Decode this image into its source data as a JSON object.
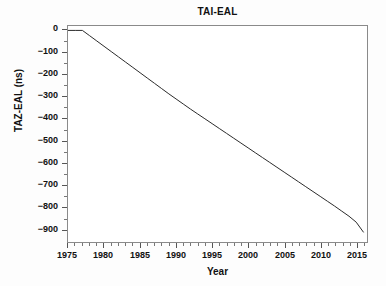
{
  "chart_data": {
    "type": "line",
    "title": "TAI-EAL",
    "xlabel": "Year",
    "ylabel": "TAZ-EAL (ns)",
    "xlim": [
      1975,
      2016.5
    ],
    "ylim": [
      -960,
      20
    ],
    "grid": false,
    "legend": null,
    "line_color": "#2b2b2b",
    "x_ticks": [
      1975,
      1980,
      1985,
      1990,
      1995,
      2000,
      2005,
      2010,
      2015
    ],
    "x_tick_labels": [
      "1975",
      "1980",
      "1985",
      "1990",
      "1995",
      "2000",
      "2005",
      "2010",
      "2015"
    ],
    "x_minor_step": 1,
    "y_ticks": [
      0,
      -100,
      -200,
      -300,
      -400,
      -500,
      -600,
      -700,
      -800,
      -900
    ],
    "y_tick_labels": [
      "0",
      "−100",
      "−200",
      "−300",
      "−400",
      "−500",
      "−600",
      "−700",
      "−800",
      "−900"
    ],
    "series": [
      {
        "name": "TAI-EAL",
        "x": [
          1975,
          1976,
          1977,
          1978,
          1979,
          1980,
          1981,
          1982,
          1983,
          1984,
          1985,
          1986,
          1987,
          1988,
          1989,
          1990,
          1991,
          1992,
          1993,
          1994,
          1995,
          1996,
          1997,
          1998,
          1999,
          2000,
          2001,
          2002,
          2003,
          2004,
          2005,
          2006,
          2007,
          2008,
          2009,
          2010,
          2011,
          2012,
          2013,
          2014,
          2015,
          2016
        ],
        "values": [
          0,
          0,
          0,
          -24,
          -48,
          -72,
          -96,
          -120,
          -144,
          -168,
          -192,
          -216,
          -240,
          -264,
          -288,
          -311,
          -334,
          -357,
          -379,
          -401,
          -423,
          -445,
          -467,
          -489,
          -511,
          -533,
          -555,
          -577,
          -599,
          -621,
          -643,
          -665,
          -687,
          -709,
          -731,
          -753,
          -775,
          -797,
          -820,
          -843,
          -870,
          -915
        ]
      }
    ]
  }
}
